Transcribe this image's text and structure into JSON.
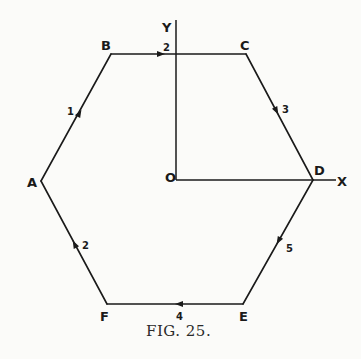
{
  "figure": {
    "caption": "Fig. 25.",
    "caption_display": "FIG. 25."
  },
  "vertices": {
    "A": "A",
    "B": "B",
    "C": "C",
    "D": "D",
    "E": "E",
    "F": "F"
  },
  "axes": {
    "origin": "O",
    "x_label": "X",
    "y_label": "Y"
  },
  "edges": [
    {
      "from": "A",
      "to": "B",
      "magnitude": "1",
      "direction": "A→B"
    },
    {
      "from": "B",
      "to": "C",
      "magnitude": "2",
      "direction": "B→C"
    },
    {
      "from": "C",
      "to": "D",
      "magnitude": "3",
      "direction": "C→D"
    },
    {
      "from": "D",
      "to": "E",
      "magnitude": "5",
      "direction": "D→E"
    },
    {
      "from": "E",
      "to": "F",
      "magnitude": "4",
      "direction": "E→F"
    },
    {
      "from": "F",
      "to": "A",
      "magnitude": "2",
      "direction": "F→A"
    }
  ]
}
